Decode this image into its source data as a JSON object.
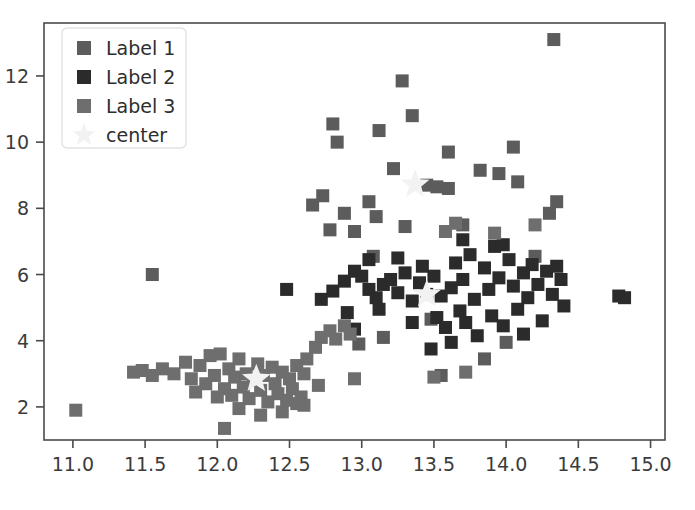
{
  "chart_data": {
    "type": "scatter",
    "title": "",
    "xlabel": "",
    "ylabel": "",
    "xlim": [
      10.8,
      15.1
    ],
    "ylim": [
      1.0,
      13.6
    ],
    "xticks": [
      "11.0",
      "11.5",
      "12.0",
      "12.5",
      "13.0",
      "13.5",
      "14.0",
      "14.5",
      "15.0"
    ],
    "xtick_values": [
      11.0,
      11.5,
      12.0,
      12.5,
      13.0,
      13.5,
      14.0,
      14.5,
      15.0
    ],
    "yticks": [
      "2",
      "4",
      "6",
      "8",
      "10",
      "12"
    ],
    "ytick_values": [
      2,
      4,
      6,
      8,
      10,
      12
    ],
    "grid": false,
    "legend_position": "upper left",
    "marker": "square",
    "marker_size": 13,
    "series": [
      {
        "name": "Label 1",
        "color": "#5c5c5c",
        "marker": "square",
        "points": [
          [
            11.55,
            6.0
          ],
          [
            12.73,
            8.38
          ],
          [
            12.66,
            8.1
          ],
          [
            12.8,
            10.55
          ],
          [
            12.83,
            10.0
          ],
          [
            12.88,
            7.85
          ],
          [
            12.78,
            7.35
          ],
          [
            12.95,
            7.3
          ],
          [
            13.05,
            8.2
          ],
          [
            13.12,
            10.35
          ],
          [
            13.1,
            7.75
          ],
          [
            13.22,
            9.2
          ],
          [
            13.28,
            11.85
          ],
          [
            13.35,
            10.8
          ],
          [
            13.08,
            6.55
          ],
          [
            13.3,
            7.45
          ],
          [
            13.45,
            8.7
          ],
          [
            13.52,
            8.65
          ],
          [
            13.6,
            8.6
          ],
          [
            13.6,
            9.7
          ],
          [
            13.7,
            7.5
          ],
          [
            13.82,
            9.15
          ],
          [
            13.95,
            9.05
          ],
          [
            14.05,
            9.85
          ],
          [
            14.08,
            8.8
          ],
          [
            14.33,
            13.1
          ],
          [
            14.3,
            7.85
          ],
          [
            14.35,
            8.2
          ],
          [
            14.2,
            6.55
          ],
          [
            13.15,
            4.1
          ],
          [
            13.48,
            4.65
          ],
          [
            12.98,
            3.9
          ],
          [
            13.85,
            3.45
          ],
          [
            14.0,
            3.95
          ],
          [
            13.55,
            2.95
          ]
        ]
      },
      {
        "name": "Label 2",
        "color": "#2b2b2b",
        "marker": "square",
        "points": [
          [
            12.48,
            5.55
          ],
          [
            12.72,
            5.25
          ],
          [
            12.8,
            5.5
          ],
          [
            12.88,
            5.8
          ],
          [
            12.95,
            6.1
          ],
          [
            13.0,
            5.95
          ],
          [
            13.05,
            5.55
          ],
          [
            13.1,
            5.3
          ],
          [
            13.15,
            5.7
          ],
          [
            13.2,
            5.85
          ],
          [
            13.25,
            5.45
          ],
          [
            13.3,
            6.05
          ],
          [
            13.35,
            5.2
          ],
          [
            13.4,
            5.75
          ],
          [
            13.45,
            5.4
          ],
          [
            13.5,
            5.95
          ],
          [
            13.52,
            4.7
          ],
          [
            13.55,
            5.35
          ],
          [
            13.58,
            4.4
          ],
          [
            13.62,
            5.6
          ],
          [
            13.65,
            6.35
          ],
          [
            13.68,
            4.9
          ],
          [
            13.7,
            5.85
          ],
          [
            13.72,
            4.55
          ],
          [
            13.75,
            6.6
          ],
          [
            13.78,
            5.25
          ],
          [
            13.8,
            4.15
          ],
          [
            13.85,
            6.2
          ],
          [
            13.88,
            5.55
          ],
          [
            13.9,
            4.75
          ],
          [
            13.92,
            6.85
          ],
          [
            13.95,
            5.9
          ],
          [
            13.98,
            4.45
          ],
          [
            14.02,
            6.45
          ],
          [
            14.05,
            5.65
          ],
          [
            14.08,
            4.95
          ],
          [
            14.12,
            6.05
          ],
          [
            14.15,
            5.3
          ],
          [
            14.18,
            6.3
          ],
          [
            14.22,
            5.7
          ],
          [
            14.25,
            4.6
          ],
          [
            14.28,
            6.1
          ],
          [
            14.32,
            5.4
          ],
          [
            14.35,
            6.25
          ],
          [
            14.38,
            5.85
          ],
          [
            14.4,
            5.05
          ],
          [
            14.78,
            5.35
          ],
          [
            14.82,
            5.3
          ],
          [
            12.9,
            4.85
          ],
          [
            13.12,
            4.95
          ],
          [
            13.35,
            4.55
          ],
          [
            13.42,
            6.25
          ],
          [
            13.25,
            6.5
          ],
          [
            13.05,
            6.45
          ],
          [
            12.95,
            4.35
          ],
          [
            13.62,
            3.95
          ],
          [
            13.48,
            3.75
          ],
          [
            14.12,
            4.2
          ],
          [
            13.98,
            6.9
          ],
          [
            13.7,
            7.05
          ]
        ]
      },
      {
        "name": "Label 3",
        "color": "#6e6e6e",
        "marker": "square",
        "points": [
          [
            11.02,
            1.9
          ],
          [
            11.42,
            3.05
          ],
          [
            11.48,
            3.1
          ],
          [
            11.55,
            2.95
          ],
          [
            11.62,
            3.15
          ],
          [
            11.7,
            3.0
          ],
          [
            11.78,
            3.35
          ],
          [
            11.82,
            2.85
          ],
          [
            11.88,
            3.25
          ],
          [
            11.92,
            2.7
          ],
          [
            11.95,
            3.55
          ],
          [
            11.98,
            2.95
          ],
          [
            12.02,
            3.6
          ],
          [
            12.05,
            2.55
          ],
          [
            12.08,
            3.15
          ],
          [
            12.1,
            2.35
          ],
          [
            12.12,
            2.9
          ],
          [
            12.15,
            3.45
          ],
          [
            12.18,
            2.6
          ],
          [
            12.2,
            3.0
          ],
          [
            12.22,
            2.25
          ],
          [
            12.25,
            2.8
          ],
          [
            12.28,
            3.3
          ],
          [
            12.3,
            2.5
          ],
          [
            12.32,
            2.95
          ],
          [
            12.35,
            2.15
          ],
          [
            12.38,
            3.2
          ],
          [
            12.4,
            2.7
          ],
          [
            12.42,
            2.4
          ],
          [
            12.45,
            3.05
          ],
          [
            12.48,
            2.2
          ],
          [
            12.5,
            2.85
          ],
          [
            12.52,
            2.55
          ],
          [
            12.55,
            3.25
          ],
          [
            12.58,
            2.3
          ],
          [
            12.6,
            3.0
          ],
          [
            12.05,
            1.35
          ],
          [
            12.3,
            1.75
          ],
          [
            12.45,
            1.85
          ],
          [
            12.62,
            3.45
          ],
          [
            12.68,
            3.8
          ],
          [
            12.72,
            4.1
          ],
          [
            12.78,
            4.3
          ],
          [
            12.82,
            4.05
          ],
          [
            12.88,
            4.45
          ],
          [
            12.92,
            4.2
          ],
          [
            12.6,
            2.05
          ],
          [
            12.55,
            2.1
          ],
          [
            11.85,
            2.45
          ],
          [
            12.0,
            2.3
          ],
          [
            12.15,
            1.95
          ],
          [
            13.72,
            3.05
          ],
          [
            13.5,
            2.9
          ],
          [
            14.2,
            7.5
          ],
          [
            13.65,
            7.55
          ],
          [
            13.58,
            7.3
          ],
          [
            13.92,
            7.25
          ],
          [
            12.95,
            2.85
          ],
          [
            12.7,
            2.65
          ]
        ]
      },
      {
        "name": "center",
        "color": "#f2f2f2",
        "marker": "star",
        "points": [
          [
            12.27,
            2.85
          ],
          [
            13.37,
            8.72
          ],
          [
            13.45,
            5.4
          ]
        ]
      }
    ],
    "legend": [
      {
        "label": "Label 1",
        "color": "#5c5c5c",
        "marker": "square"
      },
      {
        "label": "Label 2",
        "color": "#2b2b2b",
        "marker": "square"
      },
      {
        "label": "Label 3",
        "color": "#6e6e6e",
        "marker": "square"
      },
      {
        "label": "center",
        "color": "#f2f2f2",
        "marker": "star"
      }
    ]
  },
  "axes": {
    "frame_color": "#4a4a4a",
    "background": "#ffffff"
  }
}
